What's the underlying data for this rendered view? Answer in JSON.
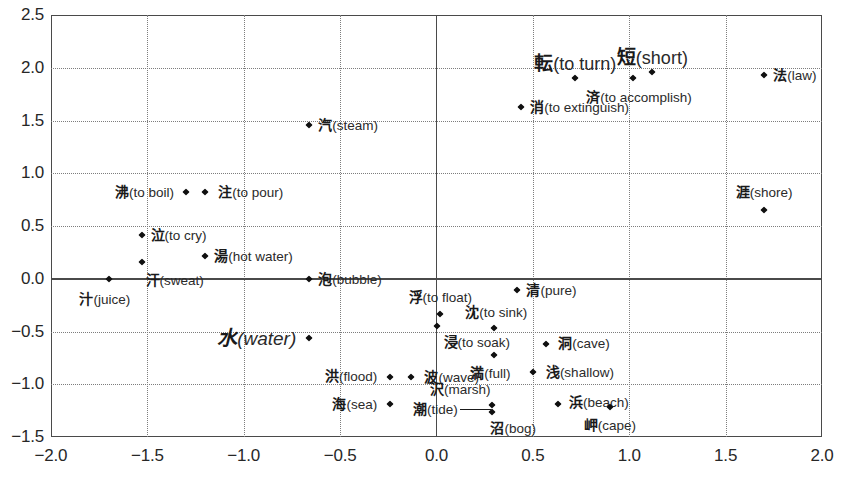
{
  "figure": {
    "width": 844,
    "height": 482,
    "background": "#ffffff",
    "marker_color": "#101010",
    "grid_color": "#7d7d7d",
    "frame_color": "#4a4a4a"
  },
  "chart_data": {
    "type": "scatter",
    "title": "",
    "subtitle": "",
    "xlabel": "",
    "ylabel": "",
    "xlim": [
      -2.0,
      2.0
    ],
    "ylim": [
      -1.5,
      2.5
    ],
    "xticks": [
      "-2.0",
      "-1.5",
      "-1.0",
      "-0.5",
      "0.0",
      "0.5",
      "1.0",
      "1.5",
      "2.0"
    ],
    "xtick_values": [
      -2.0,
      -1.5,
      -1.0,
      -0.5,
      0.0,
      0.5,
      1.0,
      1.5,
      2.0
    ],
    "yticks": [
      "2.5",
      "2.0",
      "1.5",
      "1.0",
      "0.5",
      "0.0",
      "-0.5",
      "-1.0",
      "-1.5"
    ],
    "ytick_values": [
      2.5,
      2.0,
      1.5,
      1.0,
      0.5,
      0.0,
      -0.5,
      -1.0,
      -1.5
    ],
    "grid": true,
    "grid_style": "dotted",
    "legend": null,
    "origin_axes": true,
    "points": [
      {
        "kanji": "転",
        "gloss": "(to turn)",
        "x": 0.72,
        "y": 1.9,
        "label_pos": "above",
        "emphasis": "large"
      },
      {
        "kanji": "短",
        "gloss": "(short)",
        "x": 1.12,
        "y": 1.96,
        "label_pos": "above",
        "emphasis": "large"
      },
      {
        "kanji": "済",
        "gloss": "(to accomplish)",
        "x": 1.02,
        "y": 1.9,
        "label_pos": "below",
        "emphasis": "normal"
      },
      {
        "kanji": "法",
        "gloss": "(law)",
        "x": 1.7,
        "y": 1.93,
        "label_pos": "right",
        "emphasis": "normal"
      },
      {
        "kanji": "消",
        "gloss": "(to extinguish)",
        "x": 0.44,
        "y": 1.63,
        "label_pos": "right",
        "emphasis": "normal"
      },
      {
        "kanji": "汽",
        "gloss": "(steam)",
        "x": -0.66,
        "y": 1.46,
        "label_pos": "right",
        "emphasis": "normal"
      },
      {
        "kanji": "沸",
        "gloss": "(to boil)",
        "x": -1.3,
        "y": 0.82,
        "label_pos": "left",
        "emphasis": "normal"
      },
      {
        "kanji": "注",
        "gloss": "(to pour)",
        "x": -1.2,
        "y": 0.82,
        "label_pos": "right",
        "emphasis": "normal"
      },
      {
        "kanji": "涯",
        "gloss": "(shore)",
        "x": 1.7,
        "y": 0.65,
        "label_pos": "above",
        "emphasis": "normal"
      },
      {
        "kanji": "泣",
        "gloss": "(to cry)",
        "x": -1.53,
        "y": 0.41,
        "label_pos": "right",
        "emphasis": "normal"
      },
      {
        "kanji": "湯",
        "gloss": "(hot water)",
        "x": -1.2,
        "y": 0.22,
        "label_pos": "right",
        "emphasis": "normal"
      },
      {
        "kanji": "汗",
        "gloss": "(sweat)",
        "x": -1.53,
        "y": 0.16,
        "label_pos": "below-right",
        "emphasis": "normal"
      },
      {
        "kanji": "汁",
        "gloss": "(juice)",
        "x": -1.7,
        "y": 0.0,
        "label_pos": "below",
        "emphasis": "normal"
      },
      {
        "kanji": "泡",
        "gloss": "(bubble)",
        "x": -0.66,
        "y": 0.0,
        "label_pos": "right",
        "emphasis": "normal"
      },
      {
        "kanji": "清",
        "gloss": "(pure)",
        "x": 0.42,
        "y": -0.11,
        "label_pos": "right",
        "emphasis": "normal"
      },
      {
        "kanji": "浮",
        "gloss": "(to float)",
        "x": 0.02,
        "y": -0.33,
        "label_pos": "above",
        "emphasis": "normal"
      },
      {
        "kanji": "沈",
        "gloss": "(to sink)",
        "x": 0.3,
        "y": -0.47,
        "label_pos": "above",
        "emphasis": "normal"
      },
      {
        "kanji": "水",
        "gloss": "(water)",
        "x": -0.66,
        "y": -0.56,
        "label_pos": "left",
        "emphasis": "water"
      },
      {
        "kanji": "浸",
        "gloss": "(to soak)",
        "x": 0.0,
        "y": -0.45,
        "label_pos": "below-left",
        "emphasis": "normal"
      },
      {
        "kanji": "洞",
        "gloss": "(cave)",
        "x": 0.57,
        "y": -0.62,
        "label_pos": "right",
        "emphasis": "normal"
      },
      {
        "kanji": "満",
        "gloss": "(full)",
        "x": 0.3,
        "y": -0.72,
        "label_pos": "below",
        "emphasis": "normal"
      },
      {
        "kanji": "浅",
        "gloss": "(shallow)",
        "x": 0.5,
        "y": -0.88,
        "label_pos": "right",
        "emphasis": "normal"
      },
      {
        "kanji": "洪",
        "gloss": "(flood)",
        "x": -0.24,
        "y": -0.93,
        "label_pos": "left",
        "emphasis": "normal"
      },
      {
        "kanji": "波",
        "gloss": "(wave)",
        "x": -0.13,
        "y": -0.93,
        "label_pos": "right",
        "emphasis": "normal"
      },
      {
        "kanji": "浜",
        "gloss": "(beach)",
        "x": 0.63,
        "y": -1.19,
        "label_pos": "right",
        "emphasis": "normal"
      },
      {
        "kanji": "岬",
        "gloss": "(cape)",
        "x": 0.9,
        "y": -1.22,
        "label_pos": "below",
        "emphasis": "normal"
      },
      {
        "kanji": "海",
        "gloss": "(sea)",
        "x": -0.24,
        "y": -1.19,
        "label_pos": "left",
        "emphasis": "normal"
      },
      {
        "kanji": "沢",
        "gloss": "(marsh)",
        "x": 0.29,
        "y": -1.2,
        "label_pos": "above-right",
        "emphasis": "normal"
      },
      {
        "kanji": "沼",
        "gloss": "(bog)",
        "x": 0.29,
        "y": -1.26,
        "label_pos": "below-right",
        "emphasis": "normal"
      },
      {
        "kanji": "潮",
        "gloss": "(tide)",
        "x": null,
        "y": null,
        "label_pos": "leader-left",
        "emphasis": "normal"
      }
    ],
    "leader_line": {
      "from_x": 0.12,
      "from_y": -1.23,
      "to_x": 0.285,
      "to_y": -1.23
    }
  }
}
